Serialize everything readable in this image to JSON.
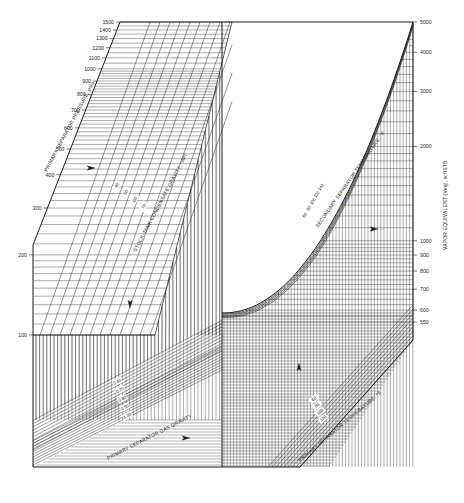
{
  "chart_data": {
    "type": "nomograph",
    "title": "",
    "axes": {
      "primary_separator_pressure": {
        "label": "PRIMARY SEPARATOR PRESSURE, psia",
        "scale": "log",
        "ticks": [
          100,
          200,
          300,
          400,
          500,
          600,
          700,
          800,
          900,
          1000,
          1100,
          1200,
          1300,
          1400,
          1500
        ],
        "tick_labels": [
          "100",
          "200",
          "300",
          "400",
          "500",
          "600",
          "700",
          "800",
          "900",
          "1000",
          "1100",
          "1200",
          "1300",
          "1400",
          "1500"
        ],
        "position": "left"
      },
      "vapor_equivalent": {
        "label": "VAPOR EQUIVALENT (Veq), scf/STB",
        "scale": "log",
        "ticks": [
          550,
          600,
          700,
          800,
          900,
          1000,
          2000,
          3000,
          4000,
          5000
        ],
        "tick_labels": [
          "550",
          "600",
          "700",
          "800",
          "900",
          "1000",
          "2000",
          "3000",
          "4000",
          "5000"
        ],
        "position": "right"
      },
      "stock_tank_condensate_gravity": {
        "label": "STOCK-TANK CONDENSATE GRAVITY, °API",
        "curve_labels": [
          "40",
          "50",
          "60",
          "70"
        ]
      },
      "secondary_separator_temperature": {
        "label": "SECONDARY SEPARATOR TEMPERATURE, °F",
        "curve_labels": [
          "60",
          "80",
          "100",
          "120",
          "140"
        ]
      },
      "primary_separator_gas_gravity": {
        "label": "PRIMARY SEPARATOR GAS GRAVITY",
        "curve_labels": [
          "0.60",
          "0.70",
          "0.80",
          "0.90",
          "1.00"
        ]
      },
      "primary_separator_temperature": {
        "label": "PRIMARY SEPARATOR TEMPERATURE, °F",
        "curve_labels": [
          "60",
          "80",
          "100",
          "120"
        ]
      }
    },
    "direction_arrows": [
      {
        "at": "upper-left panel",
        "direction": "right"
      },
      {
        "at": "left vertical panel",
        "direction": "down"
      },
      {
        "at": "lower-left panel",
        "direction": "right"
      },
      {
        "at": "lower-right panel",
        "direction": "up"
      },
      {
        "at": "upper-right panel",
        "direction": "right"
      }
    ],
    "grid": true,
    "legend": null
  },
  "labels": {
    "pressure_title": "PRIMARY SEPARATOR PRESSURE, psia",
    "veq_title": "VAPOR EQUIVALENT (Veq), scf/STB",
    "api_title": "STOCK-TANK CONDENSATE GRAVITY, °API",
    "sec_temp_title": "SECONDARY SEPARATOR TEMPERATURE, °F",
    "gas_grav_title": "PRIMARY SEPARATOR GAS GRAVITY",
    "prim_temp_title": "PRIMARY SEPARATOR TEMPERATURE, °F"
  },
  "colors": {
    "ink": "#1a1a1a",
    "grid": "#2b2b2b",
    "paper": "#ffffff"
  }
}
